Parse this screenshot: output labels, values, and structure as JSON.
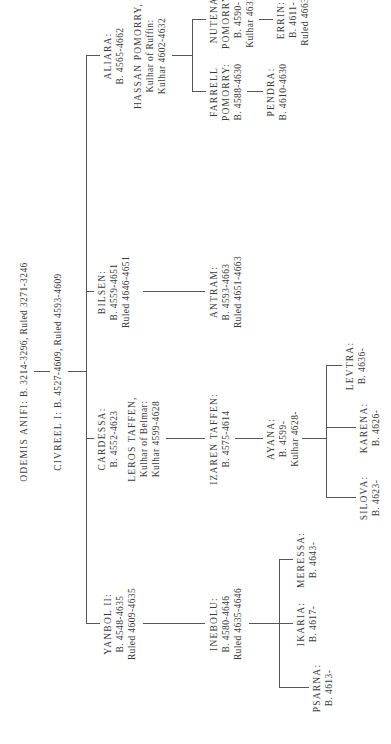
{
  "root": {
    "name": "ODEMIS ANIFI:",
    "dates": "B. 3214-3296, Ruled 3271-3246"
  },
  "king": {
    "name": "CIVREEL I:",
    "dates": "B. 4527-4609, Ruled 4593-4609"
  },
  "children": [
    {
      "name": "YANBOL II:",
      "lines": [
        "B. 4548-4635",
        "Ruled 4609-4635"
      ]
    },
    {
      "name": "CARDESSA:",
      "lines": [
        "B. 4552-4623"
      ],
      "spouse": {
        "name": "LEROS TAFFEN,",
        "lines": [
          "Kulhar of Belmar:",
          "Kulhar 4599-4628"
        ]
      }
    },
    {
      "name": "BILSEN:",
      "lines": [
        "B. 4559-4651",
        "Ruled 4646-4651"
      ]
    },
    {
      "name": "ALIARA:",
      "lines": [
        "B. 4565-4662"
      ],
      "spouse": {
        "name": "HASSAN POMORRY,",
        "lines": [
          "Kulhar of Ruffin:",
          "Kulhar 4602-4632"
        ]
      }
    }
  ],
  "grandchildren": [
    {
      "name": "INEBOLU:",
      "lines": [
        "B. 4580-4646",
        "Ruled 4635-4646"
      ]
    },
    {
      "name": "IZAREN TAFFEN:",
      "lines": [
        "B. 4575-4614"
      ]
    },
    {
      "name": "ANTRAM:",
      "lines": [
        "B. 4593-4663",
        "Ruled 4651-4663"
      ]
    },
    {
      "name_lines": [
        "FARRELL",
        "POMORRY:"
      ],
      "lines": [
        "B. 4588-4630"
      ]
    },
    {
      "name_lines": [
        "NUTENA",
        "POMORRY:"
      ],
      "lines": [
        "B. 4590-",
        "Kulhar 4632-"
      ]
    }
  ],
  "great_grandchildren": [
    {
      "name": "PSARNA:",
      "lines": [
        "B. 4613-"
      ]
    },
    {
      "name": "IKARIA:",
      "lines": [
        "B. 4617-"
      ]
    },
    {
      "name": "MERESSA:",
      "lines": [
        "B. 4643-"
      ]
    },
    {
      "name": "AYANA:",
      "lines": [
        "B. 4599-",
        "Kulhar 4628-"
      ]
    },
    {
      "name": "PENDRA:",
      "lines": [
        "B. 4610-4630"
      ]
    },
    {
      "name": "ERRIN:",
      "lines": [
        "B. 4611-",
        "Ruled 4663-"
      ]
    }
  ],
  "great_great_grandchildren": [
    {
      "name": "SILOVA:",
      "lines": [
        "B. 4623-"
      ]
    },
    {
      "name": "KARENA:",
      "lines": [
        "B. 4626-"
      ]
    },
    {
      "name": "LEVTRA:",
      "lines": [
        "B. 4636-"
      ]
    }
  ]
}
